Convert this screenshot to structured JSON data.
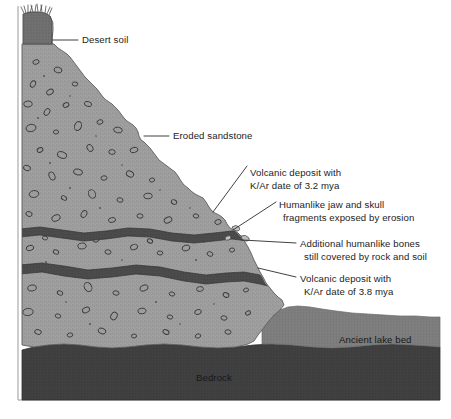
{
  "figure": {
    "type": "stratigraphic-cross-section"
  },
  "labels": {
    "desert_soil": "Desert soil",
    "eroded_sandstone": "Eroded sandstone",
    "volcanic_upper_line1": "Volcanic deposit with",
    "volcanic_upper_line2": "K/Ar date of 3.2 mya",
    "fossils_exposed_line1": "Humanlike jaw and skull",
    "fossils_exposed_line2": "fragments exposed by erosion",
    "fossils_covered_line1": "Additional humanlike bones",
    "fossils_covered_line2": "still covered by rock and soil",
    "volcanic_lower_line1": "Volcanic deposit with",
    "volcanic_lower_line2": "K/Ar date of 3.8 mya",
    "ancient_lake_bed": "Ancient lake bed",
    "bedrock": "Bedrock"
  },
  "layers": [
    {
      "name": "desert-soil",
      "label": "Desert soil",
      "color": "#6f6f6f",
      "position": "top cap of the bluff"
    },
    {
      "name": "eroded-sandstone",
      "label": "Eroded sandstone",
      "color": "#9a9a9a",
      "position": "main eroded slope body with pebble clasts"
    },
    {
      "name": "volcanic-deposit-upper",
      "label": "Volcanic deposit with K/Ar date of 3.2 mya",
      "color": "#4a4a4a",
      "date": "3.2 mya",
      "method": "K/Ar"
    },
    {
      "name": "volcanic-deposit-lower",
      "label": "Volcanic deposit with K/Ar date of 3.8 mya",
      "color": "#4a4a4a",
      "date": "3.8 mya",
      "method": "K/Ar"
    },
    {
      "name": "ancient-lake-bed",
      "label": "Ancient lake bed",
      "color": "#7d7d7d",
      "position": "lower right basin fill"
    },
    {
      "name": "bedrock",
      "label": "Bedrock",
      "color": "#3f3f3f",
      "position": "basal unit"
    }
  ],
  "colors": {
    "background": "#ffffff",
    "desert_soil": "#6f6f6f",
    "sandstone": "#9a9a9a",
    "volcanic": "#4a4a4a",
    "lake_bed": "#7d7d7d",
    "bedrock": "#3f3f3f",
    "text": "#1c1c1c",
    "leader_line": "#2b2b2b",
    "frame": "#9a9a9a"
  },
  "dates": {
    "upper_volcanic_mya": 3.2,
    "lower_volcanic_mya": 3.8,
    "method": "K/Ar"
  }
}
